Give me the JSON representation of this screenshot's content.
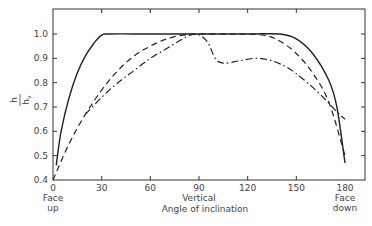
{
  "chart_data": {
    "type": "line",
    "title": "",
    "xlabel": "Angle of inclination",
    "ylabel": "h / h_v",
    "ylabel_numerator": "h",
    "ylabel_denominator": "h_v",
    "xlim": [
      0,
      180
    ],
    "ylim": [
      0.4,
      1.08
    ],
    "grid": false,
    "legend": "none",
    "x_ticks": [
      0,
      30,
      60,
      90,
      120,
      150,
      180
    ],
    "x_tick_labels": [
      "0",
      "30",
      "60",
      "90",
      "120",
      "150",
      "180"
    ],
    "y_ticks": [
      0.4,
      0.5,
      0.6,
      0.7,
      0.8,
      0.9,
      1.0
    ],
    "y_tick_labels": [
      "0.4",
      "0.5",
      "0.6",
      "0.7",
      "0.8",
      "0.9",
      "1.0"
    ],
    "annotations": [
      {
        "x": 0,
        "text_line1": "Face",
        "text_line2": "up"
      },
      {
        "x": 90,
        "text_line1": "Vertical",
        "text_line2": ""
      },
      {
        "x": 180,
        "text_line1": "Face",
        "text_line2": "down"
      }
    ],
    "series": [
      {
        "name": "solid",
        "style": "solid",
        "x": [
          2,
          5,
          10,
          15,
          20,
          25,
          30,
          35,
          60,
          90,
          120,
          140,
          150,
          160,
          170,
          175,
          180
        ],
        "values": [
          0.46,
          0.6,
          0.74,
          0.84,
          0.91,
          0.96,
          0.995,
          1.0,
          1.0,
          1.0,
          1.0,
          1.0,
          0.98,
          0.92,
          0.81,
          0.7,
          0.47
        ]
      },
      {
        "name": "dashed",
        "style": "dashed",
        "x": [
          0,
          10,
          20,
          30,
          40,
          50,
          60,
          70,
          80,
          90,
          110,
          130,
          140,
          150,
          160,
          170,
          180
        ],
        "values": [
          0.4,
          0.55,
          0.67,
          0.77,
          0.85,
          0.91,
          0.95,
          0.98,
          0.995,
          1.0,
          1.0,
          0.995,
          0.97,
          0.92,
          0.84,
          0.72,
          0.5
        ]
      },
      {
        "name": "dash-dot",
        "style": "dash-dot",
        "x": [
          20,
          30,
          40,
          50,
          60,
          70,
          80,
          88,
          95,
          100,
          105,
          115,
          125,
          135,
          145,
          155,
          165,
          175,
          180
        ],
        "values": [
          0.67,
          0.74,
          0.8,
          0.85,
          0.9,
          0.94,
          0.98,
          1.0,
          0.97,
          0.9,
          0.88,
          0.89,
          0.9,
          0.89,
          0.86,
          0.81,
          0.75,
          0.68,
          0.65
        ]
      }
    ]
  }
}
